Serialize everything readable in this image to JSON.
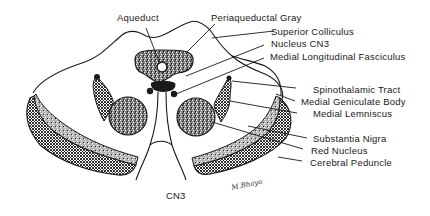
{
  "diagram": {
    "labels": {
      "aqueduct": "Aqueduct",
      "periaqueductal_gray": "Periaqueductal Gray",
      "superior_colliculus": "Superior Colliculus",
      "nucleus_cn3": "Nucleus CN3",
      "mlf": "Medial Longitudinal Fasciculus",
      "spinothalamic_tract": "Spinothalamic Tract",
      "medial_geniculate_body": "Medial Geniculate Body",
      "medial_lemniscus": "Medial Lemniscus",
      "substantia_nigra": "Substantia Nigra",
      "red_nucleus": "Red Nucleus",
      "cerebral_peduncle": "Cerebral Peduncle",
      "cn3": "CN3"
    },
    "signature": "M.Bhaya",
    "colors": {
      "ink": "#1a1a1a",
      "background": "#ffffff"
    }
  }
}
